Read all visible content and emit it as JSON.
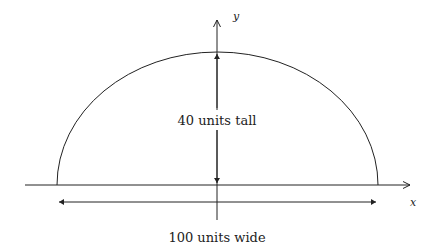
{
  "diagram": {
    "type": "semi-ellipse dimension diagram",
    "axes": {
      "x_label": "x",
      "y_label": "y"
    },
    "height_annotation": "40 units tall",
    "width_annotation": "100 units wide",
    "dimensions": {
      "width": 100,
      "height": 40
    },
    "colors": {
      "stroke": "#222222",
      "background": "#ffffff"
    }
  }
}
